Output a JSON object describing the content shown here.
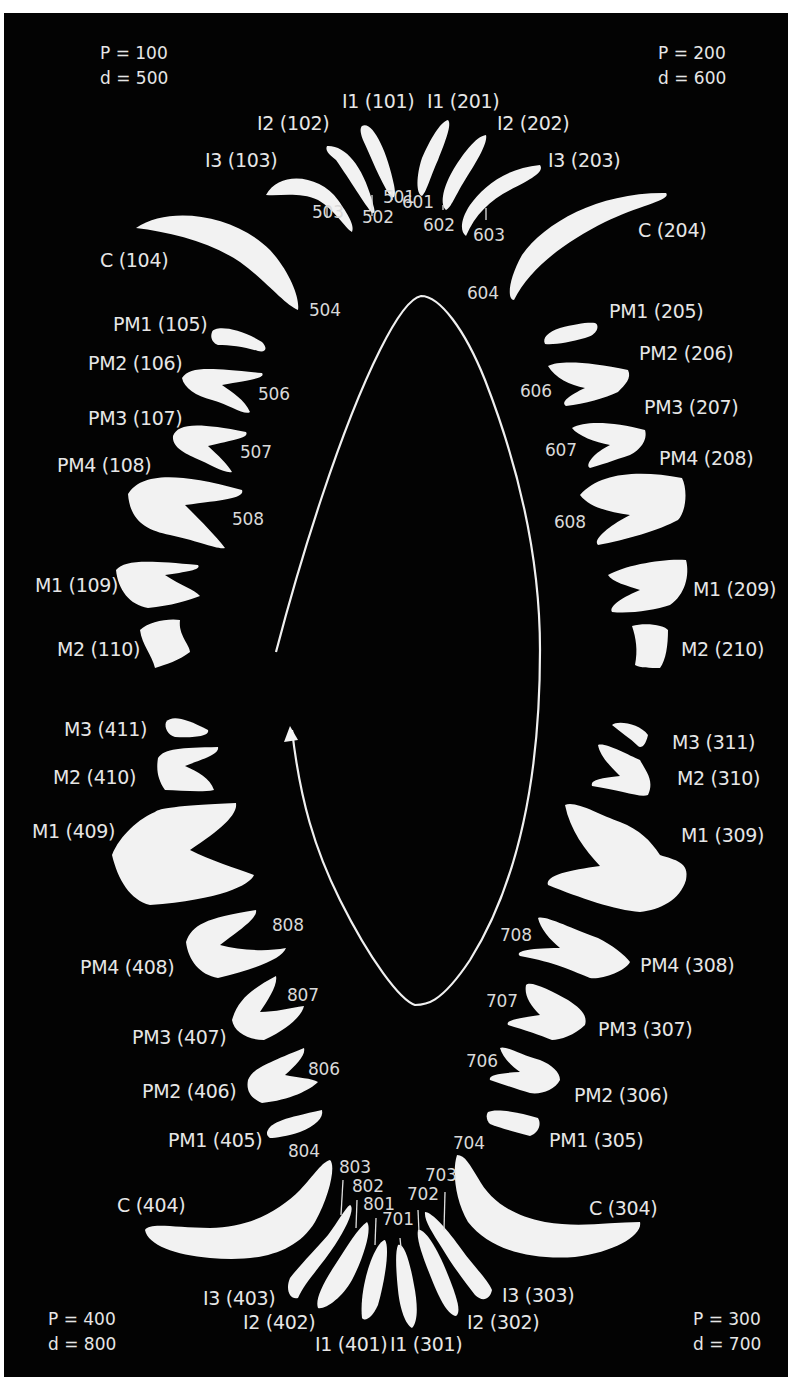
{
  "figure": {
    "background": "#030303",
    "foreground": "#e6e6e6",
    "quadrants": {
      "upper_right": {
        "p": "P = 100",
        "d": "d = 500"
      },
      "upper_left": {
        "p": "P = 200",
        "d": "d = 600"
      },
      "lower_left": {
        "p": "P = 300",
        "d": "d = 700"
      },
      "lower_right": {
        "p": "P = 400",
        "d": "d = 800"
      }
    },
    "teeth": {
      "q1": [
        {
          "label": "I1 (101)",
          "deciduous": "501"
        },
        {
          "label": "I2 (102)",
          "deciduous": "502"
        },
        {
          "label": "I3 (103)",
          "deciduous": "503"
        },
        {
          "label": "C (104)",
          "deciduous": "504"
        },
        {
          "label": "PM1 (105)"
        },
        {
          "label": "PM2 (106)",
          "deciduous": "506"
        },
        {
          "label": "PM3 (107)",
          "deciduous": "507"
        },
        {
          "label": "PM4 (108)",
          "deciduous": "508"
        },
        {
          "label": "M1 (109)"
        },
        {
          "label": "M2 (110)"
        }
      ],
      "q2": [
        {
          "label": "I1 (201)",
          "deciduous": "601"
        },
        {
          "label": "I2 (202)",
          "deciduous": "602"
        },
        {
          "label": "I3 (203)",
          "deciduous": "603"
        },
        {
          "label": "C (204)",
          "deciduous": "604"
        },
        {
          "label": "PM1 (205)"
        },
        {
          "label": "PM2 (206)",
          "deciduous": "606"
        },
        {
          "label": "PM3 (207)",
          "deciduous": "607"
        },
        {
          "label": "PM4 (208)",
          "deciduous": "608"
        },
        {
          "label": "M1 (209)"
        },
        {
          "label": "M2 (210)"
        }
      ],
      "q3": [
        {
          "label": "I1 (301)",
          "deciduous": "701"
        },
        {
          "label": "I2 (302)",
          "deciduous": "702"
        },
        {
          "label": "I3 (303)",
          "deciduous": "703"
        },
        {
          "label": "C (304)",
          "deciduous": "704"
        },
        {
          "label": "PM1 (305)"
        },
        {
          "label": "PM2 (306)",
          "deciduous": "706"
        },
        {
          "label": "PM3 (307)",
          "deciduous": "707"
        },
        {
          "label": "PM4 (308)",
          "deciduous": "708"
        },
        {
          "label": "M1 (309)"
        },
        {
          "label": "M2 (310)"
        },
        {
          "label": "M3 (311)"
        }
      ],
      "q4": [
        {
          "label": "I1 (401)",
          "deciduous": "801"
        },
        {
          "label": "I2 (402)",
          "deciduous": "802"
        },
        {
          "label": "I3 (403)",
          "deciduous": "803"
        },
        {
          "label": "C (404)",
          "deciduous": "804"
        },
        {
          "label": "PM1 (405)"
        },
        {
          "label": "PM2 (406)",
          "deciduous": "806"
        },
        {
          "label": "PM3 (407)",
          "deciduous": "807"
        },
        {
          "label": "PM4 (408)",
          "deciduous": "808"
        },
        {
          "label": "M1 (409)"
        },
        {
          "label": "M2 (410)"
        },
        {
          "label": "M3 (411)"
        }
      ]
    },
    "arrow": {
      "direction": "clockwise",
      "color": "#f0f0f0"
    }
  }
}
